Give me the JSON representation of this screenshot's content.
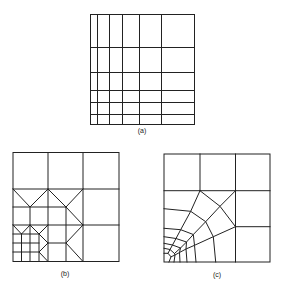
{
  "figure": {
    "panels": [
      {
        "id": "a",
        "label": "(a)",
        "description": "Graded rectangular mesh refined toward bottom-left"
      },
      {
        "id": "b",
        "label": "(b)",
        "description": "Quadtree mesh with triangular transition elements"
      },
      {
        "id": "c",
        "label": "(c)",
        "description": "Radial/fan mesh graded toward bottom-left corner"
      }
    ],
    "colors": {
      "line": "#222222",
      "background": "#ffffff"
    }
  }
}
